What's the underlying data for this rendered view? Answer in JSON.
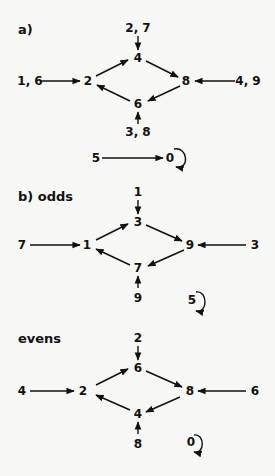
{
  "panel_a": {
    "label": "a)",
    "nodes": {
      "top": "4",
      "left": "2",
      "right": "8",
      "bottom": "6"
    },
    "feeders": {
      "top": "2, 7",
      "left": "1, 6",
      "right": "4, 9",
      "bottom": "3, 8"
    },
    "fixed": {
      "source": "5",
      "target": "0"
    }
  },
  "panel_b": {
    "label": "b)  odds",
    "nodes": {
      "top": "3",
      "left": "1",
      "right": "9",
      "bottom": "7"
    },
    "feeders": {
      "top": "1",
      "left": "7",
      "right": "3",
      "bottom": "9"
    },
    "fixed": {
      "node": "5"
    }
  },
  "panel_c": {
    "label": "evens",
    "nodes": {
      "top": "6",
      "left": "2",
      "right": "8",
      "bottom": "4"
    },
    "feeders": {
      "top": "2",
      "left": "4",
      "right": "6",
      "bottom": "8"
    },
    "fixed": {
      "node": "0"
    }
  }
}
